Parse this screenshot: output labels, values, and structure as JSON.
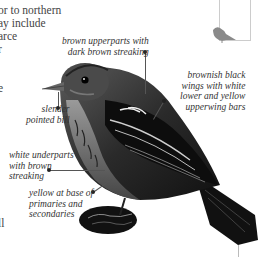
{
  "body_text": {
    "lines": [
      "or to northern",
      "ay include",
      "arce",
      "r",
      "",
      "",
      "e"
    ],
    "bottom_fragment": "ll"
  },
  "callouts": {
    "upperparts": [
      "brown upperparts with",
      "dark brown streaking"
    ],
    "wings": [
      "brownish black",
      "wings with white",
      "lower and yellow",
      "upperwing bars"
    ],
    "bill": [
      "slender",
      "pointed bill"
    ],
    "underparts": [
      "white underparts",
      "with brown",
      "streaking"
    ],
    "yellow": [
      "yellow at base of",
      "primaries and",
      "secondaries"
    ]
  },
  "colors": {
    "bird_dark": "#1a1a1a",
    "bird_mid": "#6b6b6b",
    "thumbnail_bird": "#8a8a8a"
  }
}
